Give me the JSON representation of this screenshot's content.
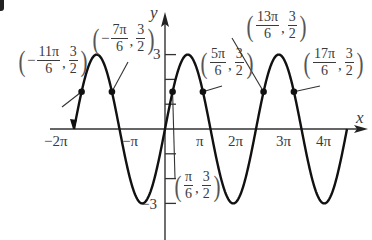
{
  "corner_mark": "partial-glyph",
  "axes": {
    "x_label": "x",
    "y_label": "y",
    "x_ticks": [
      {
        "label": "−2π",
        "value": -6.2832
      },
      {
        "label": "−π",
        "value": -3.1416
      },
      {
        "label": "π",
        "value": 3.1416
      },
      {
        "label": "2π",
        "value": 6.2832
      },
      {
        "label": "3π",
        "value": 9.4248
      },
      {
        "label": "4π",
        "value": 12.5664
      }
    ],
    "y_ticks": [
      {
        "label": "3",
        "value": 3
      },
      {
        "label": "−3",
        "value": -3
      }
    ],
    "y_minor_ticks": [
      2,
      1,
      -1,
      -2
    ]
  },
  "points": [
    {
      "sign": "−",
      "num": "11π",
      "den": "6",
      "ynum": "3",
      "yden": "2"
    },
    {
      "sign": "−",
      "num": "7π",
      "den": "6",
      "ynum": "3",
      "yden": "2"
    },
    {
      "sign": "",
      "num": "π",
      "den": "6",
      "ynum": "3",
      "yden": "2"
    },
    {
      "sign": "",
      "num": "5π",
      "den": "6",
      "ynum": "3",
      "yden": "2"
    },
    {
      "sign": "",
      "num": "13π",
      "den": "6",
      "ynum": "3",
      "yden": "2"
    },
    {
      "sign": "",
      "num": "17π",
      "den": "6",
      "ynum": "3",
      "yden": "2"
    }
  ],
  "chart_data": {
    "type": "line",
    "title": "",
    "function": "y = 3 sin x",
    "xlabel": "x",
    "ylabel": "y",
    "xlim": [
      -6.2832,
      12.5664
    ],
    "ylim": [
      -3,
      3
    ],
    "x_tick_labels": [
      "−2π",
      "−π",
      "π",
      "2π",
      "3π",
      "4π"
    ],
    "y_tick_labels": [
      "3",
      "−3"
    ],
    "grid": false,
    "series": [
      {
        "name": "3 sin x",
        "amplitude": 3,
        "period": 6.2832,
        "x_start": -6.2832,
        "x_end": 12.5664
      }
    ],
    "marked_points": [
      {
        "x_label": "−11π/6",
        "x": -5.7596,
        "y": 1.5
      },
      {
        "x_label": "−7π/6",
        "x": -3.6652,
        "y": 1.5
      },
      {
        "x_label": "π/6",
        "x": 0.5236,
        "y": 1.5
      },
      {
        "x_label": "5π/6",
        "x": 2.618,
        "y": 1.5
      },
      {
        "x_label": "13π/6",
        "x": 6.8068,
        "y": 1.5
      },
      {
        "x_label": "17π/6",
        "x": 8.9012,
        "y": 1.5
      }
    ]
  }
}
